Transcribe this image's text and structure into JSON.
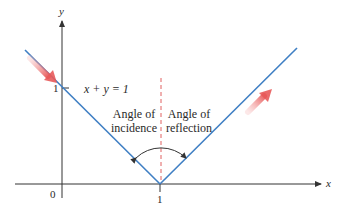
{
  "diagram": {
    "axes": {
      "x_label": "x",
      "y_label": "y",
      "origin_label": "0",
      "x_tick_label": "1",
      "y_tick_label": "1"
    },
    "equation_label": "x + y = 1",
    "angle_of_incidence": {
      "line1": "Angle of",
      "line2": "incidence"
    },
    "angle_of_reflection": {
      "line1": "Angle of",
      "line2": "reflection"
    },
    "colors": {
      "ray": "#3f7fc4",
      "normal": "#e06060",
      "arrow": "#ef6b6b",
      "axis": "#333333",
      "arc": "#333333"
    }
  }
}
